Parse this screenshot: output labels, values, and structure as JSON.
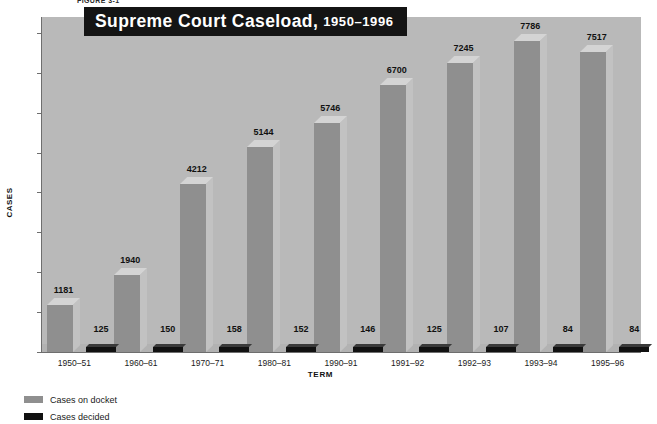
{
  "figure_caption": "FIGURE 3-1",
  "title": {
    "main": "Supreme Court Caseload,",
    "years": "1950–1996"
  },
  "axis": {
    "y_title": "CASES",
    "x_title": "TERM",
    "y_ticks": [
      "0",
      "1000",
      "2000",
      "3000",
      "4000",
      "5000",
      "6000",
      "7000",
      "8000"
    ]
  },
  "legend": [
    {
      "label": "Cases on docket",
      "color": "#8f8f8f"
    },
    {
      "label": "Cases decided",
      "color": "#111111"
    }
  ],
  "colors": {
    "plot_background": "#b9b9b9",
    "bar_docket": "#8f8f8f",
    "bar_docket_top": "#d4d4d4",
    "bar_docket_side": "#c2c2c2",
    "bar_decided": "#111111",
    "title_banner": "#141414",
    "title_text": "#ffffff",
    "axis_line": "#6e6e6e"
  },
  "chart_data": {
    "type": "bar",
    "title": "Supreme Court Caseload, 1950–1996",
    "xlabel": "TERM",
    "ylabel": "CASES",
    "ylim": [
      0,
      8400
    ],
    "grid": false,
    "legend_position": "bottom-left",
    "categories": [
      "1950–51",
      "1960–61",
      "1970–71",
      "1980–81",
      "1990–91",
      "1991–92",
      "1992–93",
      "1993–94",
      "1995–96"
    ],
    "series": [
      {
        "name": "Cases on docket",
        "color": "#8f8f8f",
        "values": [
          1181,
          1940,
          4212,
          5144,
          5746,
          6700,
          7245,
          7786,
          7517
        ]
      },
      {
        "name": "Cases decided",
        "color": "#111111",
        "values": [
          125,
          150,
          158,
          152,
          146,
          125,
          107,
          84,
          84
        ]
      }
    ]
  }
}
